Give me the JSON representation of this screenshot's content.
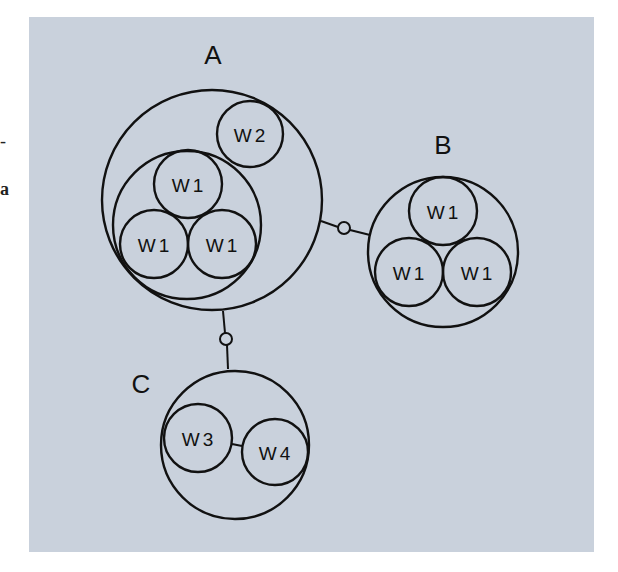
{
  "margin_fragments": {
    "dash": "-",
    "letter": "a"
  },
  "colors": {
    "panel_background": "#c9d1dc",
    "stroke": "#111111"
  },
  "diagram": {
    "groups": [
      {
        "id": "A",
        "label": "A",
        "members": [
          {
            "label": "W2"
          },
          {
            "subgroup": [
              "W1",
              "W1",
              "W1"
            ]
          }
        ]
      },
      {
        "id": "B",
        "label": "B",
        "members": [
          {
            "label": "W1"
          },
          {
            "label": "W1"
          },
          {
            "label": "W1"
          }
        ]
      },
      {
        "id": "C",
        "label": "C",
        "members": [
          {
            "label": "W3"
          },
          {
            "label": "W4"
          }
        ]
      }
    ],
    "connections": [
      {
        "from": "A",
        "to": "B",
        "joint": "small-circle"
      },
      {
        "from": "A",
        "to": "C",
        "joint": "small-circle"
      },
      {
        "from": "W3",
        "to": "W4",
        "joint": "line"
      }
    ],
    "labels": {
      "A": "A",
      "B": "B",
      "C": "C",
      "a_w2": "W2",
      "a_w1_top": "W1",
      "a_w1_left": "W1",
      "a_w1_right": "W1",
      "b_w1_top": "W1",
      "b_w1_left": "W1",
      "b_w1_right": "W1",
      "c_w3": "W3",
      "c_w4": "W4"
    }
  }
}
